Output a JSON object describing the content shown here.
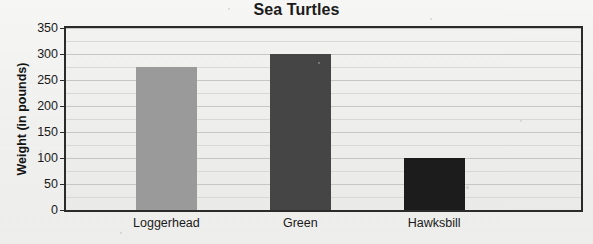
{
  "chart_data": {
    "type": "bar",
    "title": "Sea Turtles",
    "xlabel": "",
    "ylabel": "Weight (in pounds)",
    "categories": [
      "Loggerhead",
      "Green",
      "Hawksbill"
    ],
    "values": [
      275,
      300,
      100
    ],
    "ylim": [
      0,
      350
    ],
    "ytick_labels": [
      "0",
      "50",
      "100",
      "150",
      "200",
      "250",
      "300",
      "350"
    ],
    "ytick_values": [
      0,
      50,
      100,
      150,
      200,
      250,
      300,
      350
    ],
    "gridlines": true,
    "minor_gridline_step": 25,
    "legend": null,
    "bar_colors": [
      "#9a9a9a",
      "#454545",
      "#1c1c1c"
    ],
    "plot_border_color": "#2b2b2b",
    "background_color": "#f1f1ef",
    "plot_background_color": "#eeeeec",
    "gridline_color": "#c6c6c4"
  }
}
